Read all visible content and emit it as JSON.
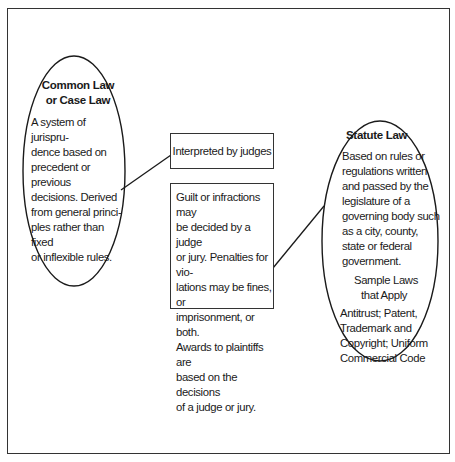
{
  "diagram": {
    "common_law": {
      "title_line1": "Common Law",
      "title_line2": "or Case Law",
      "description_lines": [
        "A system of jurispru-",
        "dence based on",
        "precedent or previous",
        "decisions. Derived",
        "from general princi-",
        "ples rather than fixed",
        "or inflexible rules."
      ]
    },
    "interpreted_box": {
      "label": "Interpreted by judges"
    },
    "penalties_box": {
      "lines": [
        "Guilt or infractions may",
        "be decided by a judge",
        "or jury. Penalties for vio-",
        "lations may be fines, or",
        "imprisonment, or both.",
        "Awards to plaintiffs are",
        "based on the decisions",
        "of a judge or jury."
      ]
    },
    "statute_law": {
      "title": "Statute Law",
      "description_lines": [
        "Based on rules or",
        "regulations written",
        "and passed by the",
        "legislature of a",
        "governing body such",
        "as a city, county,",
        "state or federal",
        "government."
      ],
      "sample_heading_line1": "Sample Laws",
      "sample_heading_line2": "that Apply",
      "sample_lines": [
        "Antitrust; Patent,",
        "Trademark and",
        "Copyright; Uniform",
        "Commercial Code"
      ]
    },
    "colors": {
      "stroke": "#1a1a1a",
      "background": "#ffffff"
    }
  }
}
